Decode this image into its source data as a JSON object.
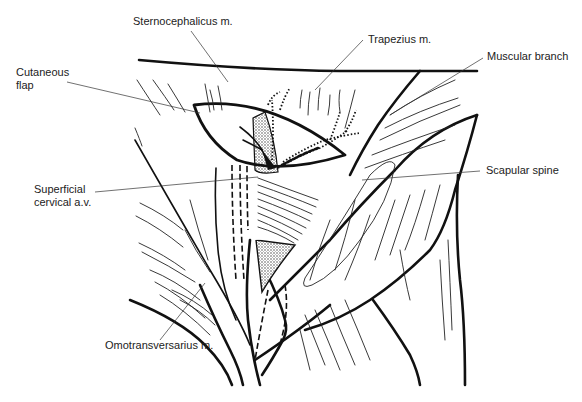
{
  "figure": {
    "type": "anatomical line drawing",
    "labels": {
      "sternocephalicus": "Sternocephalicus m.",
      "trapezius": "Trapezius m.",
      "muscular_branch": "Muscular branch",
      "cutaneous_flap_line1": "Cutaneous",
      "cutaneous_flap_line2": "flap",
      "superficial_cervical_line1": "Superficial",
      "superficial_cervical_line2": "cervical a.v.",
      "scapular_spine": "Scapular spine",
      "omotransversarius": "Omotransversarius m."
    }
  }
}
